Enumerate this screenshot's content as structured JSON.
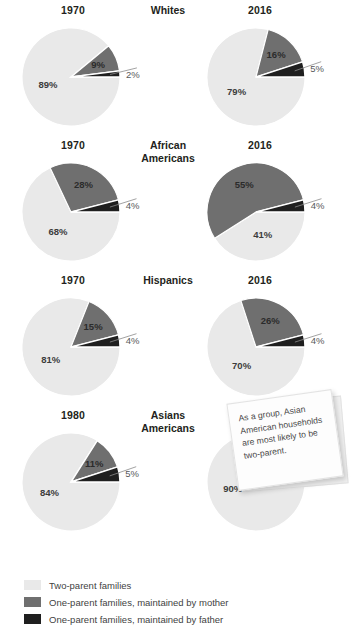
{
  "chart_data": {
    "type": "pie",
    "title": "",
    "legend_position": "bottom",
    "categories": [
      "Two-parent families",
      "One-parent families, maintained by mother",
      "One-parent families, maintained by father"
    ],
    "colors": {
      "two_parent": "#e9e9e9",
      "mother": "#6f6f6f",
      "father": "#1f1f1f",
      "text": "#231f20",
      "label_gray": "#58595b",
      "background": "#ffffff"
    },
    "groups": [
      {
        "name": "Whites",
        "charts": [
          {
            "year": "1970",
            "slices": [
              {
                "label": "Two-parent families",
                "value": 89,
                "display": "89%",
                "key": "two_parent"
              },
              {
                "label": "One-parent families, maintained by mother",
                "value": 9,
                "display": "9%",
                "key": "mother"
              },
              {
                "label": "One-parent families, maintained by father",
                "value": 2,
                "display": "2%",
                "key": "father"
              }
            ]
          },
          {
            "year": "2016",
            "slices": [
              {
                "label": "Two-parent families",
                "value": 79,
                "display": "79%",
                "key": "two_parent"
              },
              {
                "label": "One-parent families, maintained by mother",
                "value": 16,
                "display": "16%",
                "key": "mother"
              },
              {
                "label": "One-parent families, maintained by father",
                "value": 5,
                "display": "5%",
                "key": "father"
              }
            ]
          }
        ]
      },
      {
        "name": "African Americans",
        "charts": [
          {
            "year": "1970",
            "slices": [
              {
                "label": "Two-parent families",
                "value": 68,
                "display": "68%",
                "key": "two_parent"
              },
              {
                "label": "One-parent families, maintained by mother",
                "value": 28,
                "display": "28%",
                "key": "mother"
              },
              {
                "label": "One-parent families, maintained by father",
                "value": 4,
                "display": "4%",
                "key": "father"
              }
            ]
          },
          {
            "year": "2016",
            "slices": [
              {
                "label": "Two-parent families",
                "value": 41,
                "display": "41%",
                "key": "two_parent"
              },
              {
                "label": "One-parent families, maintained by mother",
                "value": 55,
                "display": "55%",
                "key": "mother"
              },
              {
                "label": "One-parent families, maintained by father",
                "value": 4,
                "display": "4%",
                "key": "father"
              }
            ]
          }
        ]
      },
      {
        "name": "Hispanics",
        "charts": [
          {
            "year": "1970",
            "slices": [
              {
                "label": "Two-parent families",
                "value": 81,
                "display": "81%",
                "key": "two_parent"
              },
              {
                "label": "One-parent families, maintained by mother",
                "value": 15,
                "display": "15%",
                "key": "mother"
              },
              {
                "label": "One-parent families, maintained by father",
                "value": 4,
                "display": "4%",
                "key": "father"
              }
            ]
          },
          {
            "year": "2016",
            "slices": [
              {
                "label": "Two-parent families",
                "value": 70,
                "display": "70%",
                "key": "two_parent"
              },
              {
                "label": "One-parent families, maintained by mother",
                "value": 26,
                "display": "26%",
                "key": "mother"
              },
              {
                "label": "One-parent families, maintained by father",
                "value": 4,
                "display": "4%",
                "key": "father"
              }
            ]
          }
        ]
      },
      {
        "name": "Asians Americans",
        "charts": [
          {
            "year": "1980",
            "slices": [
              {
                "label": "Two-parent families",
                "value": 84,
                "display": "84%",
                "key": "two_parent"
              },
              {
                "label": "One-parent families, maintained by mother",
                "value": 11,
                "display": "11%",
                "key": "mother"
              },
              {
                "label": "One-parent families, maintained by father",
                "value": 5,
                "display": "5%",
                "key": "father"
              }
            ]
          },
          {
            "year": "2016",
            "slices": [
              {
                "label": "Two-parent families",
                "value": 90,
                "display": "90%",
                "key": "two_parent"
              },
              {
                "label": "One-parent families, maintained by mother",
                "value": 8,
                "display": "8%",
                "key": "mother"
              },
              {
                "label": "One-parent families, maintained by father",
                "value": 2,
                "display": "2%",
                "key": "father"
              }
            ]
          }
        ]
      }
    ]
  },
  "rows": [
    {
      "group_line1": "Whites",
      "group_line2": "",
      "year_left": "1970",
      "year_right": "2016"
    },
    {
      "group_line1": "African",
      "group_line2": "Americans",
      "year_left": "1970",
      "year_right": "2016"
    },
    {
      "group_line1": "Hispanics",
      "group_line2": "",
      "year_left": "1970",
      "year_right": "2016"
    },
    {
      "group_line1": "Asians",
      "group_line2": "Americans",
      "year_left": "1980",
      "year_right": "2016"
    }
  ],
  "callout": {
    "text": "As a group, Asian American households are most likely to be two-parent."
  },
  "legend": {
    "items": [
      {
        "label": "Two-parent families",
        "color": "#e9e9e9"
      },
      {
        "label": "One-parent families, maintained by mother",
        "color": "#6f6f6f"
      },
      {
        "label": "One-parent families, maintained by father",
        "color": "#1f1f1f"
      }
    ]
  }
}
